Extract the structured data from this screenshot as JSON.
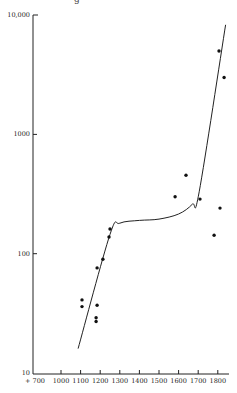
{
  "chart_data": {
    "type": "scatter",
    "title": "",
    "xlabel": "",
    "ylabel": "",
    "y_scale": "log",
    "ylim": [
      10,
      10000
    ],
    "xlim": [
      700,
      1850
    ],
    "x_axis_break": true,
    "grid": false,
    "legend": null,
    "y_ticks": [
      {
        "value": 10000,
        "label": "10,000"
      },
      {
        "value": 1000,
        "label": "1000"
      },
      {
        "value": 100,
        "label": "100"
      },
      {
        "value": 10,
        "label": "10"
      }
    ],
    "x_ticks": [
      {
        "value": 700,
        "label": "+ 700"
      },
      {
        "value": 1000,
        "label": "1000"
      },
      {
        "value": 1100,
        "label": "1100"
      },
      {
        "value": 1200,
        "label": "1200"
      },
      {
        "value": 1300,
        "label": "1300"
      },
      {
        "value": 1400,
        "label": "1400"
      },
      {
        "value": 1500,
        "label": "1500"
      },
      {
        "value": 1600,
        "label": "1600"
      },
      {
        "value": 1700,
        "label": "1700"
      },
      {
        "value": 1800,
        "label": "1800"
      }
    ],
    "series": [
      {
        "name": "observations",
        "kind": "scatter",
        "points": [
          {
            "x": 1107,
            "y": 41
          },
          {
            "x": 1107,
            "y": 36
          },
          {
            "x": 1184,
            "y": 37
          },
          {
            "x": 1179,
            "y": 29
          },
          {
            "x": 1179,
            "y": 27
          },
          {
            "x": 1184,
            "y": 76
          },
          {
            "x": 1214,
            "y": 90
          },
          {
            "x": 1245,
            "y": 138
          },
          {
            "x": 1250,
            "y": 161
          },
          {
            "x": 1582,
            "y": 300
          },
          {
            "x": 1638,
            "y": 455
          },
          {
            "x": 1709,
            "y": 287
          },
          {
            "x": 1781,
            "y": 143
          },
          {
            "x": 1811,
            "y": 241
          },
          {
            "x": 1806,
            "y": 5000
          },
          {
            "x": 1832,
            "y": 3000
          }
        ]
      },
      {
        "name": "fitted curve",
        "kind": "line",
        "points": [
          {
            "x": 1087,
            "y": 16
          },
          {
            "x": 1250,
            "y": 145
          },
          {
            "x": 1300,
            "y": 180
          },
          {
            "x": 1400,
            "y": 190
          },
          {
            "x": 1500,
            "y": 195
          },
          {
            "x": 1600,
            "y": 215
          },
          {
            "x": 1670,
            "y": 260
          },
          {
            "x": 1705,
            "y": 330
          },
          {
            "x": 1840,
            "y": 8300
          }
        ]
      }
    ]
  },
  "page": {
    "top_cut_text": "g"
  }
}
